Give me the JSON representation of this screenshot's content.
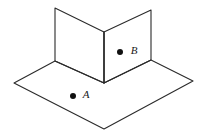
{
  "figure": {
    "background_color": "#ffffff",
    "stroke_color": "#2b2b2b",
    "face_fill": "#ffffff",
    "stroke_width": 1.1,
    "width": 206,
    "height": 138
  },
  "surfaces": {
    "floor": {
      "name": "horizontal-plane",
      "points": "14,83 55,61 104,83 151,60 193,81 104,129"
    },
    "left_wall": {
      "name": "left-vertical-plane",
      "points": "55,8 104,32 104,83 55,61"
    },
    "right_wall": {
      "name": "right-vertical-plane",
      "points": "104,32 151,10 151,60 104,83"
    }
  },
  "edges": {
    "floor_outline": "M14,83 L55,61 L104,83 L151,60 L193,81 L104,129 Z",
    "left_wall_outline": "M55,8 L104,32 L104,83 L55,61 Z",
    "right_wall_outline": "M104,32 L151,10 L151,60 L104,83 Z",
    "center_ridge": "M104,32 L104,83"
  },
  "points": [
    {
      "id": "point-a",
      "label": "A",
      "dot_x": 73,
      "dot_y": 96,
      "dot_r": 3.0,
      "label_x": 86,
      "label_y": 95,
      "dot_color": "#111111",
      "on_surface": "horizontal-plane"
    },
    {
      "id": "point-b",
      "label": "B",
      "dot_x": 120,
      "dot_y": 52,
      "dot_r": 3.0,
      "label_x": 134,
      "label_y": 51,
      "dot_color": "#111111",
      "on_surface": "right-vertical-plane"
    }
  ]
}
